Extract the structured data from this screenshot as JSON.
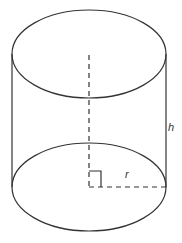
{
  "diagram": {
    "labels": {
      "height": "h",
      "radius": "r"
    },
    "stroke_color": "#333333"
  }
}
